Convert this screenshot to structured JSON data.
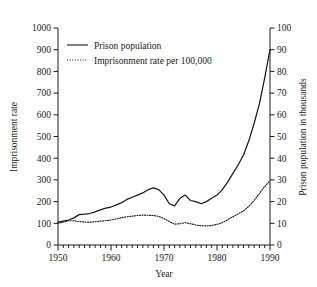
{
  "chart_data": {
    "type": "line",
    "title": "",
    "xlabel": "Year",
    "ylabel": "Imprisonment rate",
    "y2label": "Prison population in thousands",
    "xlim": [
      1950,
      1990
    ],
    "ylim": [
      0,
      1000
    ],
    "y2lim": [
      0,
      100
    ],
    "grid": false,
    "legend_position": "top-left-inside",
    "x_ticks": [
      1950,
      1960,
      1970,
      1980,
      1990
    ],
    "x_tick_labels": [
      "1950",
      "1960",
      "1970",
      "1980",
      "1990"
    ],
    "x_minor_tick_step": 1,
    "y_ticks": [
      0,
      100,
      200,
      300,
      400,
      500,
      600,
      700,
      800,
      900,
      1000
    ],
    "y_tick_labels": [
      "0",
      "100",
      "200",
      "300",
      "400",
      "500",
      "600",
      "700",
      "800",
      "900",
      "1000"
    ],
    "y2_ticks": [
      0,
      10,
      20,
      30,
      40,
      50,
      60,
      70,
      80,
      90,
      100
    ],
    "y2_tick_labels": [
      "0",
      "10",
      "20",
      "30",
      "40",
      "50",
      "60",
      "70",
      "80",
      "90",
      "100"
    ],
    "x": [
      1950,
      1951,
      1952,
      1953,
      1954,
      1955,
      1956,
      1957,
      1958,
      1959,
      1960,
      1961,
      1962,
      1963,
      1964,
      1965,
      1966,
      1967,
      1968,
      1969,
      1970,
      1971,
      1972,
      1973,
      1974,
      1975,
      1976,
      1977,
      1978,
      1979,
      1980,
      1981,
      1982,
      1983,
      1984,
      1985,
      1986,
      1987,
      1988,
      1989,
      1990
    ],
    "series": [
      {
        "name": "Prison population",
        "style": "solid",
        "axis": "right",
        "units": "thousands",
        "color": "#1a1a1a",
        "values": [
          10.5,
          11.0,
          11.5,
          12.5,
          14.0,
          14.2,
          14.5,
          15.3,
          16.2,
          17.0,
          17.5,
          18.5,
          19.5,
          21.0,
          22.0,
          23.0,
          24.0,
          25.5,
          26.3,
          25.5,
          23.0,
          19.0,
          18.0,
          21.5,
          23.0,
          20.5,
          20.0,
          19.0,
          20.0,
          21.5,
          23.0,
          25.5,
          29.0,
          33.0,
          37.0,
          41.5,
          48.0,
          56.0,
          65.0,
          77.0,
          90.0
        ]
      },
      {
        "name": "Imprisonment rate per 100,000",
        "style": "dotted",
        "axis": "left",
        "units": "per 100,000",
        "color": "#1a1a1a",
        "values": [
          100,
          105,
          112,
          112,
          108,
          106,
          105,
          107,
          110,
          112,
          115,
          120,
          126,
          130,
          133,
          136,
          138,
          137,
          136,
          132,
          122,
          108,
          96,
          98,
          103,
          98,
          92,
          89,
          88,
          90,
          95,
          103,
          116,
          130,
          143,
          157,
          178,
          205,
          237,
          270,
          295
        ]
      }
    ],
    "legend": [
      {
        "label": "Prison population",
        "style": "solid"
      },
      {
        "label": "Imprisonment rate per 100,000",
        "style": "dotted"
      }
    ]
  }
}
